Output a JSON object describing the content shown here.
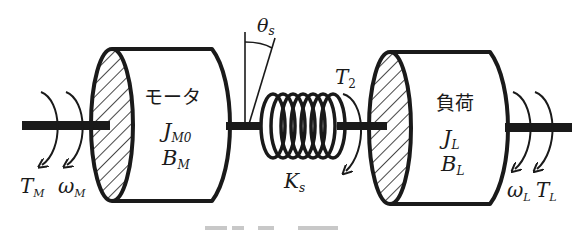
{
  "diagram": {
    "colors": {
      "stroke": "#1a1a1a",
      "background": "#ffffff",
      "caption_fade": "#c8c8c8"
    },
    "motor": {
      "name": "モータ",
      "inertia": {
        "base": "J",
        "sub": "M0"
      },
      "damping": {
        "base": "B",
        "sub": "M"
      }
    },
    "load": {
      "name": "負荷",
      "inertia": {
        "base": "J",
        "sub": "L"
      },
      "damping": {
        "base": "B",
        "sub": "L"
      }
    },
    "spring": {
      "stiffness": {
        "base": "K",
        "sub": "s"
      },
      "twist_angle": {
        "base": "θ",
        "sub": "s"
      }
    },
    "torques": {
      "motor_torque": {
        "base": "T",
        "sub": "M"
      },
      "motor_speed": {
        "base": "ω",
        "sub": "M"
      },
      "shaft_torque": {
        "base": "T",
        "sub": "2"
      },
      "load_speed": {
        "base": "ω",
        "sub": "L"
      },
      "load_torque": {
        "base": "T",
        "sub": "L"
      }
    }
  }
}
